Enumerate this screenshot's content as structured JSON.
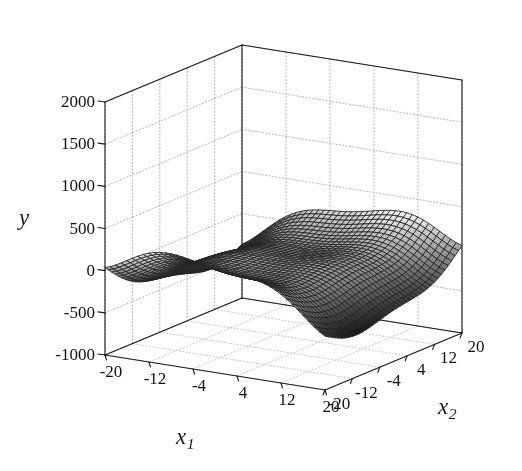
{
  "figure": {
    "width": 522,
    "height": 471,
    "background": "#ffffff",
    "type": "3d-surface-mesh-plot"
  },
  "axes": {
    "y": {
      "label": "y",
      "ticks": [
        2000,
        1500,
        1000,
        500,
        0,
        -500,
        -1000
      ],
      "tick_labels": [
        "2000",
        "1500",
        "1000",
        "500",
        "0",
        "-500",
        "-1000"
      ],
      "range": [
        -1000,
        2000
      ]
    },
    "x1": {
      "label": "x",
      "subscript": "1",
      "ticks": [
        -20,
        -12,
        -4,
        4,
        12,
        20
      ],
      "tick_labels": [
        "-20",
        "-12",
        "-4",
        "4",
        "12",
        "20"
      ],
      "range": [
        -20,
        20
      ]
    },
    "x2": {
      "label": "x",
      "subscript": "2",
      "ticks": [
        -20,
        -12,
        -4,
        4,
        12,
        20
      ],
      "tick_labels": [
        "-20",
        "-12",
        "-4",
        "4",
        "12",
        "20"
      ],
      "range": [
        -20,
        20
      ]
    }
  },
  "colors": {
    "axis_line": "#1a1a1a",
    "grid_line": "#b4b4b4",
    "grid_line_dotted": "#c8c8c8",
    "mesh_line": "#242424",
    "text": "#111111",
    "surface_light": "#f2f2f2",
    "surface_dark": "#1e1e1e"
  },
  "chart_data": {
    "type": "surface",
    "title": "",
    "xlabel": "x1",
    "ylabel": "x2",
    "zlabel": "y",
    "xlim": [
      -20,
      20
    ],
    "ylim": [
      -20,
      20
    ],
    "zlim": [
      -1000,
      2000
    ],
    "grid": true,
    "legend": null,
    "colormap": "gray",
    "shading": "faceted",
    "mesh_resolution": 40,
    "surface_description": "Saddle-like double-lobed surface: a large dominant lobe rising to about 1800 over the low-x1 region with a deep basin descending below -1000, and a smaller secondary ridge near high x2 rising to about 800.",
    "formula": "y = x1^2 * cos(x1/6) - x2^2 * cos(x2/7) * 0.6 + x1*x2*0.5",
    "z_min_observed": -1200,
    "z_max_observed": 1850,
    "surface_samples": {
      "x1": [
        -20,
        -12,
        -4,
        4,
        12,
        20
      ],
      "x2": [
        -20,
        -12,
        -4,
        4,
        12,
        20
      ],
      "z": [
        [
          520,
          1100,
          1580,
          1700,
          1300,
          420
        ],
        [
          120,
          700,
          1200,
          1320,
          900,
          30
        ],
        [
          -520,
          60,
          560,
          680,
          270,
          -600
        ],
        [
          -900,
          -320,
          170,
          300,
          -110,
          -980
        ],
        [
          -620,
          -40,
          450,
          580,
          170,
          -700
        ],
        [
          160,
          740,
          1240,
          1360,
          950,
          70
        ]
      ]
    }
  },
  "view": {
    "azimuth": -37.5,
    "elevation": 30,
    "projection": "orthographic"
  }
}
